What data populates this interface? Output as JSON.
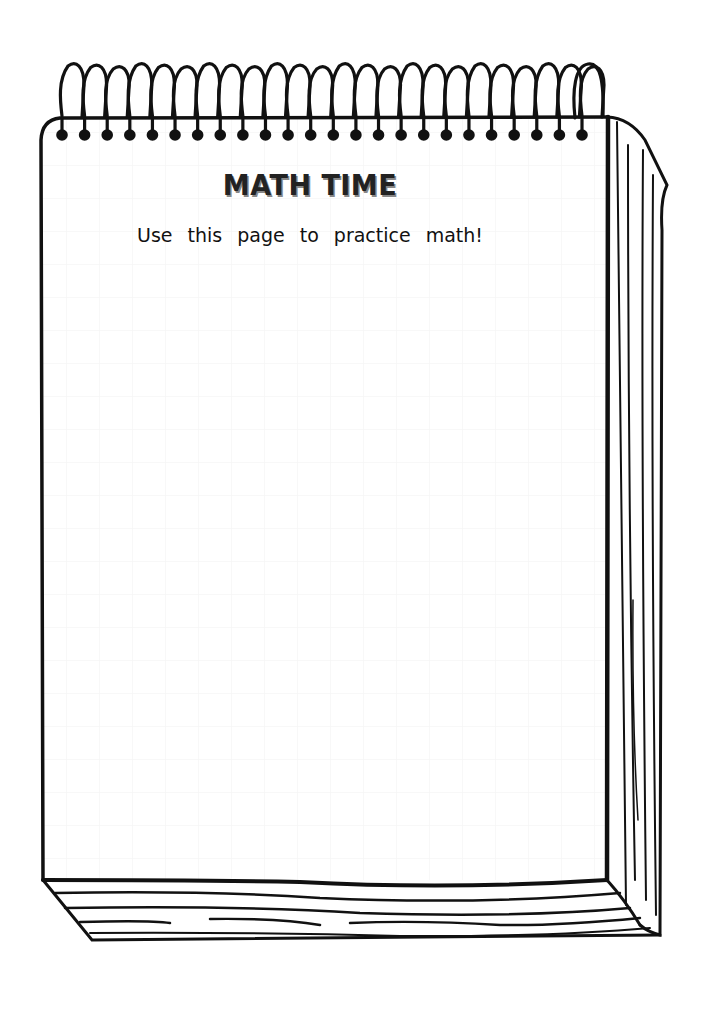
{
  "worksheet": {
    "title": "MATH TIME",
    "subtitle": "Use this page to practice math!"
  },
  "notepad": {
    "spiral_ring_count": 24,
    "ink_color": "#111111",
    "paper_color": "#ffffff",
    "grid_color": "#f4f4f4"
  }
}
